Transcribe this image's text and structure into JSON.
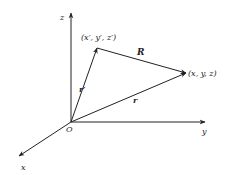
{
  "diagram": {
    "type": "vector-position-diagram",
    "axes": {
      "z_label": "z",
      "y_label": "y",
      "x_label": "x",
      "origin_label": "O"
    },
    "points": {
      "source_label": "(x′, y′, z′)",
      "field_label": "(x, y, z)"
    },
    "vectors": {
      "R_label": "R",
      "r_prime_label": "r′",
      "r_label": "r"
    },
    "colors": {
      "line": "#222222",
      "background": "#ffffff"
    }
  }
}
